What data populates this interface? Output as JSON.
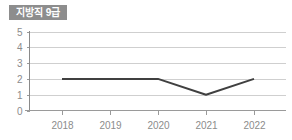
{
  "panel": {
    "background_color": "#ffffff"
  },
  "title_badge": {
    "label": "지방직 9급",
    "background_color": "#8d8d8d",
    "text_color": "#ffffff"
  },
  "chart_data": {
    "type": "line",
    "title": "지방직 9급",
    "xlabel": "",
    "ylabel": "",
    "categories": [
      "2018",
      "2019",
      "2020",
      "2021",
      "2022"
    ],
    "values": [
      2,
      2,
      2,
      1,
      2
    ],
    "series": [
      {
        "name": "지방직 9급",
        "values": [
          2,
          2,
          2,
          1,
          2
        ],
        "color": "#404040"
      }
    ],
    "ylim": [
      0,
      5
    ],
    "y_ticks": [
      "0",
      "1",
      "2",
      "3",
      "4",
      "5"
    ],
    "x_ticks": [
      "2018",
      "2019",
      "2020",
      "2021",
      "2022"
    ],
    "grid": true,
    "grid_color": "#cfcfcf",
    "axis_color": "#8a8a8a",
    "tick_label_color": "#8c8c8c",
    "legend": false,
    "legend_position": "none"
  }
}
